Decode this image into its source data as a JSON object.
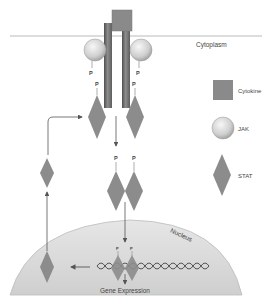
{
  "diagram": {
    "labels": {
      "cytoplasm": "Cytoplasm",
      "nucleus": "Nucleus",
      "gene_expression": "Gene Expression",
      "phosphate": "P"
    },
    "legend": [
      {
        "shape": "square",
        "label": "Cytokine"
      },
      {
        "shape": "circle",
        "label": "JAK"
      },
      {
        "shape": "diamond",
        "label": "STAT"
      }
    ],
    "colors": {
      "cytokine": "#8a8a8a",
      "stat": "#8c8c8c",
      "jak_light": "#f2f2f2",
      "jak_dark": "#a8a8a8",
      "receptor_dark": "#5a5a5a",
      "receptor_light": "#b0b0b0",
      "membrane": "#a0a0a0",
      "nucleus_fill": "#d9d9d9",
      "arrow": "#555555"
    }
  }
}
